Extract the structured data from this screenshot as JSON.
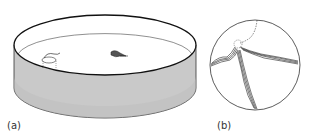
{
  "figure": {
    "panels": [
      {
        "label": "(a)",
        "description": "Circular pool (water maze) with submerged platform and swimming rat"
      },
      {
        "label": "(b)",
        "description": "Top-down view of pool showing swim path traces converging on platform location"
      }
    ],
    "colors": {
      "water": "#bdbdbd",
      "wall": "#cfcfcf",
      "stroke": "#1a1a1a",
      "background": "#ffffff"
    }
  }
}
